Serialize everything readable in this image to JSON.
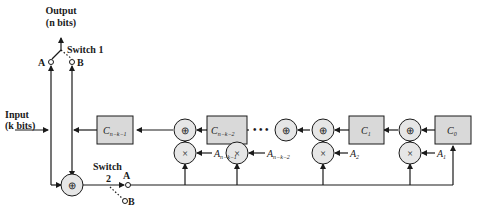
{
  "diagram": {
    "output_label": "Output",
    "output_bits": "(n bits)",
    "input_label": "Input",
    "input_bits": "(k bits)",
    "switch1_label": "Switch 1",
    "switch2_label": "Switch",
    "switch2_num": "2",
    "pos_a": "A",
    "pos_b": "B",
    "registers": [
      {
        "base": "C",
        "sub": "n−k−1"
      },
      {
        "base": "C",
        "sub": "n−k−2"
      },
      {
        "base": "C",
        "sub": "1"
      },
      {
        "base": "C",
        "sub": "0"
      }
    ],
    "coefficients": [
      {
        "base": "A",
        "sub": "n−k−1"
      },
      {
        "base": "A",
        "sub": "n−k−2"
      },
      {
        "base": "A",
        "sub": "2"
      },
      {
        "base": "A",
        "sub": "1"
      }
    ],
    "adder_symbol": "⊕",
    "multiplier_symbol": "×",
    "ellipsis": "• • •",
    "colors": {
      "box_fill": "#d9d9d9",
      "line": "#1a1a1a"
    }
  }
}
